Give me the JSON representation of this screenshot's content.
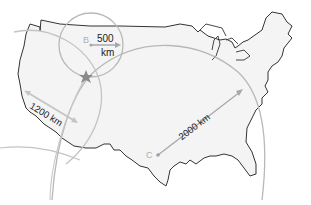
{
  "map": {
    "title": "Triangulating an earthquake epicenter (United States)",
    "region": "Contiguous United States",
    "colors": {
      "land_fill": "#f4f4f4",
      "border": "#333333",
      "circle": "#b8b8b8",
      "arrow": "#a8a8a8",
      "label": "#222222",
      "point_label": "#b0b0b0",
      "epicenter": "#8a8a8a"
    },
    "stations": [
      {
        "id": "A",
        "label": "",
        "radius_label": "1200 km",
        "radius_km": 1200
      },
      {
        "id": "B",
        "label": "B",
        "radius_label": "500\nkm",
        "radius_km": 500
      },
      {
        "id": "C",
        "label": "C",
        "radius_label": "2000 km",
        "radius_km": 2000
      }
    ],
    "labels": {
      "b_point": "B",
      "b_radius_line1": "500",
      "b_radius_line2": "km",
      "a_radius": "1200 km",
      "c_point": "C",
      "c_radius": "2000 km"
    },
    "epicenter": {
      "symbol": "star-icon",
      "label": ""
    }
  }
}
